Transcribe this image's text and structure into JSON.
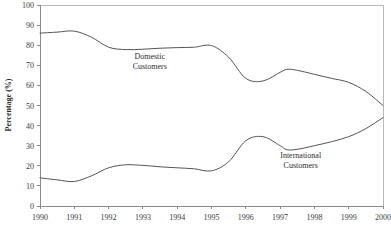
{
  "chart_data": {
    "type": "line",
    "title": "",
    "xlabel": "",
    "ylabel": "Percentage (%)",
    "xlim": [
      1990,
      2000
    ],
    "ylim": [
      0,
      100
    ],
    "grid": false,
    "legend_position": "inline-annotations",
    "x_tick_labels": [
      "1990",
      "1991",
      "1992",
      "1993",
      "1994",
      "1995",
      "1996",
      "1997",
      "1998",
      "1999",
      "2000"
    ],
    "y_tick_labels": [
      "0",
      "10",
      "20",
      "30",
      "40",
      "50",
      "60",
      "70",
      "80",
      "90",
      "100"
    ],
    "x": [
      1990,
      1990.5,
      1991,
      1991.5,
      1992,
      1992.5,
      1993,
      1993.5,
      1994,
      1994.5,
      1995,
      1995.5,
      1996,
      1996.5,
      1997,
      1997.2,
      1997.5,
      1998,
      1998.5,
      1999,
      1999.5,
      2000
    ],
    "series": [
      {
        "name": "Domestic Customers",
        "label_line1": "Domestic",
        "label_line2": "Customers",
        "color": "#555555",
        "values": [
          86,
          86.5,
          87,
          84,
          79,
          77.8,
          78,
          78.5,
          78.8,
          79,
          79.8,
          74,
          63.5,
          62.2,
          66.5,
          68,
          67.5,
          65.5,
          63.5,
          61.5,
          57,
          50
        ]
      },
      {
        "name": "International Customers",
        "label_line1": "International",
        "label_line2": "Customers",
        "color": "#555555",
        "values": [
          14,
          13,
          12.2,
          15,
          19,
          20.5,
          20.2,
          19.5,
          19,
          18.5,
          17.5,
          22,
          32.5,
          34.5,
          30,
          28,
          28.2,
          30,
          32,
          34.5,
          38.5,
          44
        ]
      }
    ],
    "annotations": [
      {
        "name": "domestic-label",
        "text_line1": "Domestic",
        "text_line2": "Customers",
        "x": 1993.2,
        "y": 73
      },
      {
        "name": "international-label",
        "text_line1": "International",
        "text_line2": "Customers",
        "x": 1997.6,
        "y": 24
      }
    ]
  }
}
